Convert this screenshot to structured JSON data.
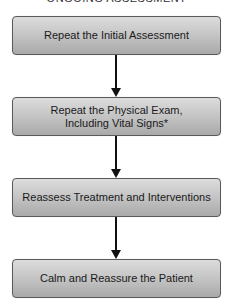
{
  "diagram": {
    "title": "ONGOING ASSESSMENT",
    "steps": [
      {
        "label": "Repeat the Initial Assessment"
      },
      {
        "label_line1": "Repeat the Physical Exam,",
        "label_line2": "Including Vital Signs*"
      },
      {
        "label": "Reassess Treatment and Interventions"
      },
      {
        "label": "Calm and Reassure the Patient"
      }
    ],
    "connectors": [
      {
        "from": 0,
        "to": 1
      },
      {
        "from": 1,
        "to": 2
      },
      {
        "from": 2,
        "to": 3
      }
    ],
    "colors": {
      "box_gradient_top": "#dcdcdc",
      "box_gradient_bottom": "#a9a9a9",
      "box_border": "#5a5a5a",
      "arrow": "#111111",
      "text": "#1a1a1a"
    }
  }
}
